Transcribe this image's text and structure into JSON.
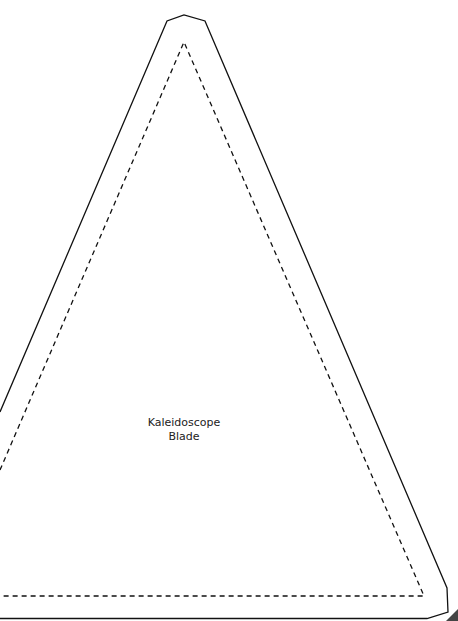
{
  "template": {
    "title_line1": "Kaleidoscope",
    "title_line2": "Blade",
    "outline_style": "solid",
    "fold_line_style": "dashed",
    "line_color": "#111111",
    "background": "#ffffff"
  }
}
